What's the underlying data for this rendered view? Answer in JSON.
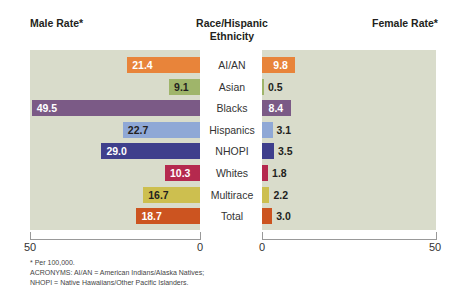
{
  "header": {
    "left_title": "Male Rate*",
    "center_title_line1": "Race/Hispanic",
    "center_title_line2": "Ethnicity",
    "right_title": "Female Rate*"
  },
  "axis": {
    "left_ticks": [
      "50",
      "0"
    ],
    "right_ticks": [
      "0",
      "50"
    ]
  },
  "footnotes": {
    "line1": "* Per 100,000.",
    "line2": "ACRONYMS: AI/AN = American Indians/Alaska Natives;",
    "line3": "NHOPI = Native Hawaiians/Other Pacific Islanders."
  },
  "rows": [
    {
      "category": "AI/AN",
      "male": "21.4",
      "female": "9.8",
      "color": "#e8843a",
      "male_text": "#ffffff",
      "female_text": "#ffffff"
    },
    {
      "category": "Asian",
      "male": "9.1",
      "female": "0.5",
      "color": "#9fb56a",
      "male_text": "#231f20",
      "female_text": "#231f20"
    },
    {
      "category": "Blacks",
      "male": "49.5",
      "female": "8.4",
      "color": "#7b5a86",
      "male_text": "#ffffff",
      "female_text": "#ffffff"
    },
    {
      "category": "Hispanics",
      "male": "22.7",
      "female": "3.1",
      "color": "#8fa8d6",
      "male_text": "#231f20",
      "female_text": "#231f20"
    },
    {
      "category": "NHOPI",
      "male": "29.0",
      "female": "3.5",
      "color": "#3f3f8c",
      "male_text": "#ffffff",
      "female_text": "#231f20"
    },
    {
      "category": "Whites",
      "male": "10.3",
      "female": "1.8",
      "color": "#b5294e",
      "male_text": "#ffffff",
      "female_text": "#231f20"
    },
    {
      "category": "Multirace",
      "male": "16.7",
      "female": "2.2",
      "color": "#cdbf4f",
      "male_text": "#231f20",
      "female_text": "#231f20"
    },
    {
      "category": "Total",
      "male": "18.7",
      "female": "3.0",
      "color": "#cc5420",
      "male_text": "#ffffff",
      "female_text": "#231f20"
    }
  ],
  "chart_data": {
    "type": "bar",
    "orientation": "horizontal",
    "title": "",
    "categories": [
      "AI/AN",
      "Asian",
      "Blacks",
      "Hispanics",
      "NHOPI",
      "Whites",
      "Multirace",
      "Total"
    ],
    "series": [
      {
        "name": "Male Rate*",
        "values": [
          21.4,
          9.1,
          49.5,
          22.7,
          29.0,
          10.3,
          16.7,
          18.7
        ]
      },
      {
        "name": "Female Rate*",
        "values": [
          9.8,
          0.5,
          8.4,
          3.1,
          3.5,
          1.8,
          2.2,
          3.0
        ]
      }
    ],
    "xlabel_left": "Male Rate*",
    "xlabel_right": "Female Rate*",
    "ylabel": "Race/Hispanic Ethnicity",
    "xlim": [
      0,
      50
    ],
    "left_ticks": [
      50,
      0
    ],
    "right_ticks": [
      0,
      50
    ],
    "grid": false,
    "legend": "none",
    "notes": [
      "* Per 100,000.",
      "ACRONYMS: AI/AN = American Indians/Alaska Natives;",
      "NHOPI = Native Hawaiians/Other Pacific Islanders."
    ]
  }
}
